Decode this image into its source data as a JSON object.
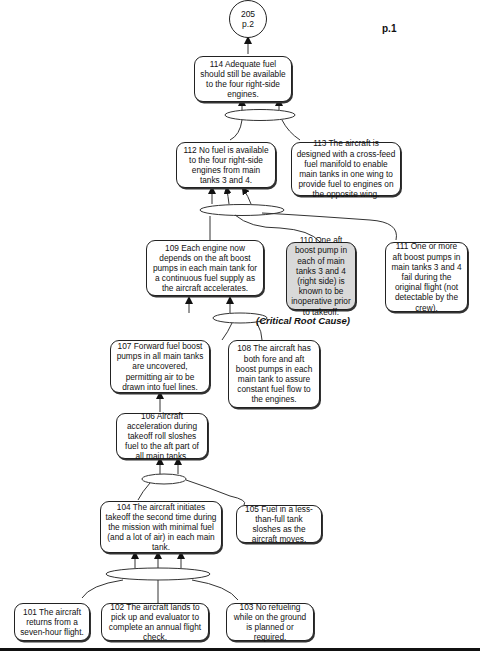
{
  "connector": {
    "label": "205",
    "page_ref": "p.2"
  },
  "page_label": "p.1",
  "critical_label": "(Critical Root Cause)",
  "nodes": {
    "n114": {
      "id": "114",
      "text": "114 Adequate fuel should still be available to the four right-side engines."
    },
    "n112": {
      "id": "112",
      "text": "112 No fuel is available to the four right-side engines from main tanks 3 and 4."
    },
    "n113": {
      "id": "113",
      "text": "113 The aircraft is designed with a cross-feed fuel manifold to enable main tanks in one wing to provide fuel to engines on the opposite wing."
    },
    "n109": {
      "id": "109",
      "text": "109 Each engine now depends on the aft boost pumps in each main tank for a continuous fuel supply as the aircraft accelerates."
    },
    "n110": {
      "id": "110",
      "text": "110 One aft boost pump in each of main tanks 3 and 4 (right side) is known to be inoperative prior to takeoff.",
      "critical": true
    },
    "n111": {
      "id": "111",
      "text": "111 One or more aft boost pumps in main tanks 3 and 4 fail during the original flight (not detectable by the crew)."
    },
    "n107": {
      "id": "107",
      "text": "107 Forward fuel boost pumps in all main tanks are uncovered, permitting air to be drawn into fuel lines."
    },
    "n108": {
      "id": "108",
      "text": "108 The aircraft has both fore and aft boost pumps in each main tank to assure constant fuel flow to the engines."
    },
    "n106": {
      "id": "106",
      "text": "106 Aircraft acceleration during takeoff roll sloshes fuel to the aft part of all main tanks."
    },
    "n104": {
      "id": "104",
      "text": "104 The aircraft initiates takeoff the second time during the mission with minimal fuel  (and a lot of air) in each main tank."
    },
    "n105": {
      "id": "105",
      "text": "105 Fuel in a less-than-full tank sloshes as the aircraft moves."
    },
    "n101": {
      "id": "101",
      "text": "101 The aircraft returns from a seven-hour flight."
    },
    "n102": {
      "id": "102",
      "text": "102 The aircraft lands to pick up and evaluator to complete an annual flight check."
    },
    "n103": {
      "id": "103",
      "text": "103 No refueling while on the ground is planned or required."
    }
  },
  "edges": [
    {
      "from": [
        "112",
        "113"
      ],
      "to": "114",
      "gate": "AND"
    },
    {
      "from": [
        "109",
        "110",
        "111"
      ],
      "to": "112",
      "gate": "AND"
    },
    {
      "from": [
        "107",
        "108"
      ],
      "to": "109",
      "gate": "AND"
    },
    {
      "from": [
        "106"
      ],
      "to": "107"
    },
    {
      "from": [
        "104",
        "105"
      ],
      "to": "106",
      "gate": "AND"
    },
    {
      "from": [
        "101",
        "102",
        "103"
      ],
      "to": "104",
      "gate": "AND"
    },
    {
      "from": [
        "114"
      ],
      "to": "205"
    }
  ],
  "colors": {
    "line": "#222222",
    "critical_fill": "#d9d9d9",
    "background": "#ffffff"
  }
}
